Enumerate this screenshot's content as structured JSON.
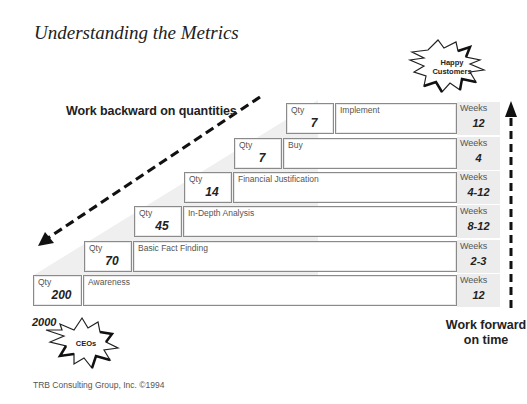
{
  "title": "Understanding the Metrics",
  "annotations": {
    "backward": "Work backward on quantities",
    "forward": "Work forward on time",
    "top_burst": "Happy Customers",
    "bottom_burst": "CEOs",
    "start_count": "2000"
  },
  "qty_label": "Qty",
  "weeks_label": "Weeks",
  "stages": [
    {
      "name": "Implement",
      "qty": "7",
      "weeks": "12"
    },
    {
      "name": "Buy",
      "qty": "7",
      "weeks": "4"
    },
    {
      "name": "Financial Justification",
      "qty": "14",
      "weeks": "4-12"
    },
    {
      "name": "In-Depth Analysis",
      "qty": "45",
      "weeks": "8-12"
    },
    {
      "name": "Basic Fact Finding",
      "qty": "70",
      "weeks": "2-3"
    },
    {
      "name": "Awareness",
      "qty": "200",
      "weeks": "12"
    }
  ],
  "footer": "TRB Consulting Group, Inc. ©1994"
}
